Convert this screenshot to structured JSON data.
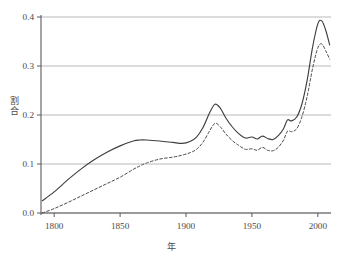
{
  "chart_data": {
    "type": "line",
    "title": "",
    "xlabel": "年",
    "ylabel": "割合",
    "ylabel_chars": [
      "割",
      "合"
    ],
    "xlim": [
      1790,
      2010
    ],
    "ylim": [
      0.0,
      0.4
    ],
    "grid": true,
    "grid_axis": "y",
    "legend": "none",
    "xticks": [
      1800,
      1850,
      1900,
      1950,
      2000
    ],
    "xtick_labels": [
      "1800",
      "1850",
      "1900",
      "1950",
      "2000"
    ],
    "yticks": [
      0.0,
      0.1,
      0.2,
      0.3,
      0.4
    ],
    "ytick_labels": [
      "0.0",
      "0.1",
      "0.2",
      "0.3",
      "0.4"
    ],
    "series": [
      {
        "name": "solid-series",
        "style": "solid",
        "color": "#3f3f43",
        "x": [
          1791,
          1800,
          1810,
          1820,
          1830,
          1840,
          1850,
          1860,
          1865,
          1870,
          1880,
          1890,
          1897,
          1903,
          1908,
          1913,
          1918,
          1922,
          1926,
          1930,
          1935,
          1940,
          1945,
          1950,
          1954,
          1958,
          1962,
          1966,
          1970,
          1974,
          1977,
          1980,
          1984,
          1988,
          1992,
          1996,
          2000,
          2003,
          2006,
          2009
        ],
        "y": [
          0.025,
          0.043,
          0.067,
          0.089,
          0.108,
          0.124,
          0.137,
          0.147,
          0.149,
          0.149,
          0.147,
          0.144,
          0.142,
          0.146,
          0.155,
          0.175,
          0.205,
          0.222,
          0.214,
          0.195,
          0.176,
          0.162,
          0.153,
          0.155,
          0.151,
          0.157,
          0.152,
          0.15,
          0.158,
          0.172,
          0.19,
          0.188,
          0.196,
          0.223,
          0.272,
          0.338,
          0.386,
          0.392,
          0.373,
          0.343
        ]
      },
      {
        "name": "dashed-series",
        "style": "dashed",
        "color": "#49494d",
        "x": [
          1791,
          1800,
          1810,
          1820,
          1830,
          1840,
          1850,
          1860,
          1865,
          1870,
          1880,
          1890,
          1897,
          1903,
          1908,
          1913,
          1918,
          1922,
          1926,
          1930,
          1935,
          1940,
          1945,
          1950,
          1954,
          1958,
          1962,
          1966,
          1970,
          1974,
          1977,
          1980,
          1984,
          1988,
          1992,
          1996,
          2000,
          2003,
          2006,
          2009
        ],
        "y": [
          0.0,
          0.009,
          0.021,
          0.034,
          0.047,
          0.06,
          0.073,
          0.089,
          0.096,
          0.102,
          0.11,
          0.114,
          0.118,
          0.123,
          0.13,
          0.145,
          0.168,
          0.183,
          0.176,
          0.162,
          0.148,
          0.138,
          0.13,
          0.131,
          0.128,
          0.134,
          0.128,
          0.127,
          0.134,
          0.149,
          0.167,
          0.166,
          0.172,
          0.197,
          0.239,
          0.295,
          0.337,
          0.345,
          0.331,
          0.314
        ]
      }
    ]
  },
  "axes": {
    "y_axis_line_color": "#5a5a5e",
    "x_axis_line_color": "#5a5a5e",
    "gridline_color": "#b9b9bd",
    "background": "#ffffff"
  }
}
